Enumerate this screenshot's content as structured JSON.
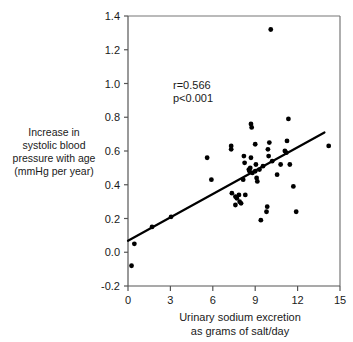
{
  "figure": {
    "top_cut_fragment": "",
    "background_color": "#ffffff",
    "point_color": "#000000",
    "line_color": "#000000",
    "axis_color": "#555555"
  },
  "annotations": {
    "r_value": "r=0.566",
    "p_value": "p<0.001"
  },
  "ylabel_lines": [
    "Increase in",
    "systolic blood",
    "pressure with age",
    "(mmHg per year)"
  ],
  "xlabel_lines": [
    "Urinary sodium excretion",
    "as grams of salt/day"
  ],
  "chart_data": {
    "type": "scatter",
    "title": "",
    "xlabel": "Urinary sodium excretion as grams of salt/day",
    "ylabel": "Increase in systolic blood pressure with age (mmHg per year)",
    "xlim": [
      0,
      15
    ],
    "ylim": [
      -0.2,
      1.4
    ],
    "xticks": [
      0,
      3,
      6,
      9,
      12,
      15
    ],
    "yticks": [
      -0.2,
      0.0,
      0.2,
      0.4,
      0.6,
      0.8,
      1.0,
      1.2,
      1.4
    ],
    "xtick_labels": [
      "0",
      "3",
      "6",
      "9",
      "12",
      "15"
    ],
    "ytick_labels": [
      "-0.2",
      "0.0",
      "0.2",
      "0.4",
      "0.6",
      "0.8",
      "1.0",
      "1.2",
      "1.4"
    ],
    "grid": false,
    "legend": false,
    "annotations": [
      "r=0.566",
      "p<0.001"
    ],
    "statistics": {
      "r": 0.566,
      "p": "<0.001"
    },
    "regression_line": {
      "x": [
        0.0,
        13.9
      ],
      "y": [
        0.068,
        0.71
      ]
    },
    "points": [
      {
        "x": 0.25,
        "y": -0.08
      },
      {
        "x": 0.45,
        "y": 0.05
      },
      {
        "x": 1.7,
        "y": 0.15
      },
      {
        "x": 3.05,
        "y": 0.21
      },
      {
        "x": 5.6,
        "y": 0.56
      },
      {
        "x": 5.9,
        "y": 0.43
      },
      {
        "x": 7.3,
        "y": 0.63
      },
      {
        "x": 7.3,
        "y": 0.61
      },
      {
        "x": 7.35,
        "y": 0.35
      },
      {
        "x": 7.6,
        "y": 0.33
      },
      {
        "x": 7.6,
        "y": 0.28
      },
      {
        "x": 7.7,
        "y": 0.32
      },
      {
        "x": 7.85,
        "y": 0.34
      },
      {
        "x": 7.9,
        "y": 0.3
      },
      {
        "x": 8.0,
        "y": 0.29
      },
      {
        "x": 8.15,
        "y": 0.43
      },
      {
        "x": 8.2,
        "y": 0.57
      },
      {
        "x": 8.25,
        "y": 0.53
      },
      {
        "x": 8.3,
        "y": 0.34
      },
      {
        "x": 8.55,
        "y": 0.49
      },
      {
        "x": 8.6,
        "y": 0.48
      },
      {
        "x": 8.65,
        "y": 0.5
      },
      {
        "x": 8.7,
        "y": 0.56
      },
      {
        "x": 8.7,
        "y": 0.76
      },
      {
        "x": 8.75,
        "y": 0.74
      },
      {
        "x": 8.8,
        "y": 0.47
      },
      {
        "x": 9.0,
        "y": 0.64
      },
      {
        "x": 9.0,
        "y": 0.48
      },
      {
        "x": 9.05,
        "y": 0.52
      },
      {
        "x": 9.1,
        "y": 0.44
      },
      {
        "x": 9.15,
        "y": 0.42
      },
      {
        "x": 9.3,
        "y": 0.49
      },
      {
        "x": 9.4,
        "y": 0.19
      },
      {
        "x": 9.55,
        "y": 0.51
      },
      {
        "x": 9.8,
        "y": 0.24
      },
      {
        "x": 9.85,
        "y": 0.27
      },
      {
        "x": 9.9,
        "y": 0.61
      },
      {
        "x": 9.95,
        "y": 0.57
      },
      {
        "x": 10.0,
        "y": 0.65
      },
      {
        "x": 10.1,
        "y": 1.32
      },
      {
        "x": 10.2,
        "y": 0.54
      },
      {
        "x": 10.55,
        "y": 0.46
      },
      {
        "x": 10.8,
        "y": 0.52
      },
      {
        "x": 11.1,
        "y": 0.6
      },
      {
        "x": 11.2,
        "y": 0.59
      },
      {
        "x": 11.25,
        "y": 0.66
      },
      {
        "x": 11.35,
        "y": 0.79
      },
      {
        "x": 11.45,
        "y": 0.52
      },
      {
        "x": 11.7,
        "y": 0.39
      },
      {
        "x": 11.9,
        "y": 0.24
      },
      {
        "x": 14.2,
        "y": 0.63
      }
    ]
  }
}
